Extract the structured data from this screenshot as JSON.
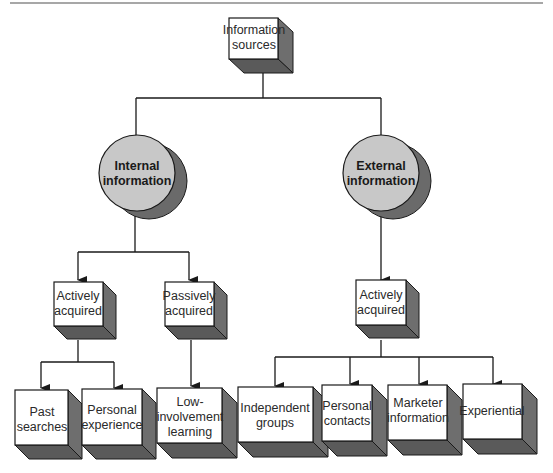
{
  "diagram": {
    "root": {
      "lines": [
        "Information",
        "sources"
      ]
    },
    "branches": [
      {
        "label_lines": [
          "Internal",
          "information"
        ],
        "children": [
          {
            "label_lines": [
              "Actively",
              "acquired"
            ],
            "children": [
              {
                "lines": [
                  "Past",
                  "searches"
                ]
              },
              {
                "lines": [
                  "Personal",
                  "experience"
                ]
              }
            ]
          },
          {
            "label_lines": [
              "Passively",
              "acquired"
            ],
            "children": [
              {
                "lines": [
                  "Low-",
                  "involvement",
                  "learning"
                ]
              }
            ]
          }
        ]
      },
      {
        "label_lines": [
          "External",
          "information"
        ],
        "children": [
          {
            "label_lines": [
              "Actively",
              "acquired"
            ],
            "children": [
              {
                "lines": [
                  "Independent",
                  "groups"
                ]
              },
              {
                "lines": [
                  "Personal",
                  "contacts"
                ]
              },
              {
                "lines": [
                  "Marketer",
                  "information"
                ]
              },
              {
                "lines": [
                  "Experiential"
                ]
              }
            ]
          }
        ]
      }
    ]
  },
  "colors": {
    "box_front": "#ffffff",
    "box_side": "#6e6e6e",
    "box_bottom": "#5a5a5a",
    "circle_fill": "#c8c8c8",
    "circle_shadow": "#6a6a6a",
    "line": "#1a1a1a",
    "top_rule": "#8a8a8a"
  }
}
